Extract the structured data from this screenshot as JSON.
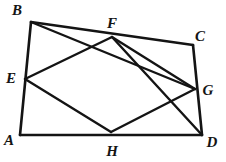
{
  "figure": {
    "type": "geometry-diagram",
    "shape_name": "quadrilateral-with-midpoint-quadrilateral",
    "width": 226,
    "height": 162,
    "background_color": "#ffffff",
    "stroke_color": "#141414",
    "label_color": "#141414",
    "points": {
      "A": {
        "label": "A",
        "x": 20,
        "y": 135,
        "label_x": 9,
        "label_y": 140
      },
      "B": {
        "label": "B",
        "x": 31,
        "y": 22,
        "label_x": 17,
        "label_y": 10
      },
      "C": {
        "label": "C",
        "x": 193,
        "y": 45,
        "label_x": 200,
        "label_y": 36
      },
      "D": {
        "label": "D",
        "x": 202,
        "y": 135,
        "label_x": 212,
        "label_y": 142
      },
      "E": {
        "label": "E",
        "x": 25,
        "y": 79,
        "label_x": 11,
        "label_y": 78
      },
      "F": {
        "label": "F",
        "x": 112,
        "y": 37,
        "label_x": 112,
        "label_y": 23
      },
      "G": {
        "label": "G",
        "x": 195,
        "y": 89,
        "label_x": 208,
        "label_y": 90
      },
      "H": {
        "label": "H",
        "x": 111,
        "y": 132,
        "label_x": 112,
        "label_y": 151
      }
    },
    "outer_edges": [
      {
        "name": "segment-AB",
        "from": "A",
        "to": "B"
      },
      {
        "name": "segment-BC",
        "from": "B",
        "to": "C"
      },
      {
        "name": "segment-CD",
        "from": "C",
        "to": "D"
      },
      {
        "name": "segment-DA",
        "from": "D",
        "to": "A"
      }
    ],
    "inner_edges": [
      {
        "name": "segment-EF",
        "from": "E",
        "to": "F"
      },
      {
        "name": "segment-FG",
        "from": "F",
        "to": "G"
      },
      {
        "name": "segment-GH",
        "from": "G",
        "to": "H"
      },
      {
        "name": "segment-HE",
        "from": "H",
        "to": "E"
      }
    ],
    "diagonals": [
      {
        "name": "segment-BG",
        "from": "B",
        "to": "G"
      },
      {
        "name": "segment-FD",
        "from": "F",
        "to": "D"
      }
    ]
  }
}
